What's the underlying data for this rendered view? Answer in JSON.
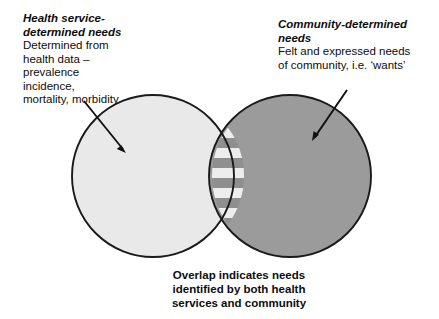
{
  "figure": {
    "type": "venn-diagram",
    "background_color": "#ffffff",
    "outline_color": "#1a1a1a"
  },
  "left_label": {
    "heading": "Health service-\ndetermined needs",
    "body": "Determined from\nhealth data –\nprevalence\nincidence,\nmortality, morbidity"
  },
  "right_label": {
    "heading": "Community-determined\nneeds",
    "body": "Felt and expressed needs\nof community, i.e. ‘wants’"
  },
  "caption": {
    "text": "Overlap indicates needs\nidentified by both health\nservices and community"
  },
  "sets": {
    "left_circle": {
      "name": "health-service-determined-needs",
      "fill": "#e9e9e9",
      "stroke": "#1a1a1a",
      "cx": 153,
      "cy": 176,
      "r": 81
    },
    "right_circle": {
      "name": "community-determined-needs",
      "fill": "#9b9b9b",
      "stroke": "#1a1a1a",
      "cx": 290,
      "cy": 176,
      "r": 81
    },
    "overlap": {
      "name": "overlap-region",
      "pattern": "horizontal-stripes",
      "stripe_light": "#ededed",
      "stripe_dark": "#8f8f8f",
      "stripe_height": 10,
      "top_vertex_y": 128,
      "bottom_vertex_y": 228
    }
  },
  "arrows": [
    {
      "name": "arrow-to-left-circle",
      "from_x": 84,
      "from_y": 101,
      "to_x": 126,
      "to_y": 153,
      "color": "#111111"
    },
    {
      "name": "arrow-to-right-circle",
      "from_x": 347,
      "from_y": 90,
      "to_x": 312,
      "to_y": 141,
      "color": "#111111"
    }
  ]
}
